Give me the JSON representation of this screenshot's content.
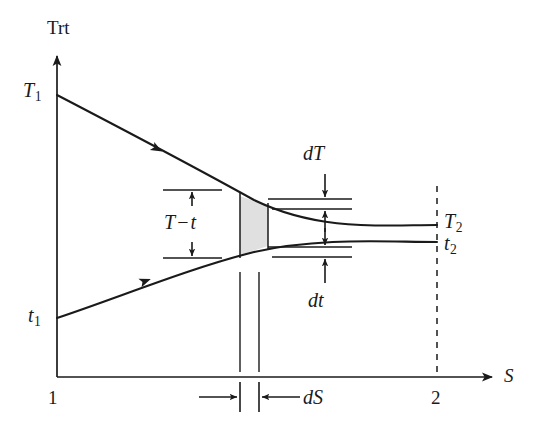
{
  "figure": {
    "kind": "thermodynamic-temperature-entropy-diagram",
    "background_color": "#ffffff",
    "line_color": "#1a1a1a",
    "shade_color": "#e0e0e0"
  },
  "axes": {
    "y_axis_label": "Trt",
    "x_axis_label": "S",
    "x_start_tick_label": "1",
    "x_end_tick_label": "2"
  },
  "curves": {
    "hot_stream": {
      "start_label": "T",
      "start_label_sub": "1",
      "end_label": "T",
      "end_label_sub": "2",
      "direction_marker": "arrowhead-right"
    },
    "cold_stream": {
      "start_label": "t",
      "start_label_sub": "1",
      "end_label": "t",
      "end_label_sub": "2",
      "direction_marker": "arrowhead-right"
    }
  },
  "annotations": {
    "temperature_difference": {
      "symbol_first": "T",
      "operator": "−",
      "symbol_second": "t"
    },
    "hot_differential": {
      "prefix": "d",
      "symbol": "T"
    },
    "cold_differential": {
      "prefix": "d",
      "symbol": "t"
    },
    "entropy_differential": {
      "prefix": "d",
      "symbol": "S"
    }
  }
}
